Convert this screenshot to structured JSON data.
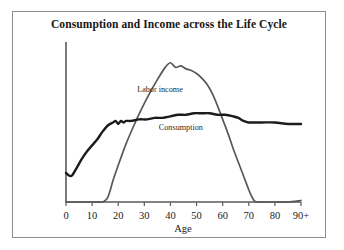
{
  "figure": {
    "title": "Consumption and Income across the Life Cycle",
    "frame_color": "#8d8d8d",
    "background": "#ffffff"
  },
  "axis": {
    "x_title": "Age",
    "tick_labels": [
      "0",
      "10",
      "20",
      "30",
      "40",
      "50",
      "60",
      "70",
      "80",
      "90+"
    ],
    "axis_color": "#5a5a5a"
  },
  "labels": {
    "labor_income": "Labor income",
    "consumption": "Consumption"
  },
  "chart_data": {
    "type": "line",
    "title": "Consumption and Income across the Life Cycle",
    "xlabel": "Age",
    "ylabel": "",
    "xlim": [
      0,
      90
    ],
    "ylim": [
      0,
      100
    ],
    "grid": false,
    "legend": "inline-annotations",
    "xticks": [
      0,
      10,
      20,
      30,
      40,
      50,
      60,
      70,
      80,
      90
    ],
    "xtick_labels": [
      "0",
      "10",
      "20",
      "30",
      "40",
      "50",
      "60",
      "70",
      "80",
      "90+"
    ],
    "yticks": [],
    "series": [
      {
        "name": "Consumption",
        "color": "#1c1c1c",
        "width": 2.4,
        "x": [
          0,
          2,
          4,
          6,
          8,
          10,
          12,
          14,
          16,
          18,
          19,
          20,
          21,
          22,
          23,
          25,
          28,
          31,
          34,
          37,
          40,
          43,
          46,
          49,
          52,
          55,
          58,
          61,
          64,
          66,
          68,
          70,
          72,
          75,
          80,
          85,
          90
        ],
        "values": [
          19,
          17,
          22,
          28,
          33,
          37,
          41,
          46,
          50,
          52,
          53,
          51,
          53,
          52,
          53,
          53,
          54,
          54,
          55,
          55,
          56,
          57,
          57,
          58,
          58,
          58,
          57,
          57,
          56,
          55,
          53,
          52,
          52,
          52,
          52,
          51,
          51
        ]
      },
      {
        "name": "Labor income",
        "color": "#585858",
        "width": 1.7,
        "x": [
          0,
          5,
          10,
          14,
          15,
          16,
          17,
          18,
          20,
          23,
          26,
          29,
          32,
          35,
          38,
          40,
          42,
          44,
          46,
          48,
          50,
          52,
          54,
          56,
          58,
          60,
          62,
          64,
          66,
          68,
          70,
          71,
          72,
          73,
          75,
          80,
          85,
          90
        ],
        "values": [
          0,
          0,
          0,
          0,
          1,
          3,
          8,
          14,
          24,
          38,
          50,
          61,
          71,
          80,
          88,
          91,
          88,
          89,
          87,
          86,
          84,
          81,
          77,
          71,
          63,
          54,
          45,
          35,
          26,
          17,
          8,
          4,
          1,
          0,
          0,
          0,
          0,
          1
        ]
      }
    ],
    "annotations": [
      {
        "text": "Labor income",
        "x": 36,
        "y": 72
      },
      {
        "text": "Consumption",
        "x": 44,
        "y": 47
      }
    ]
  }
}
